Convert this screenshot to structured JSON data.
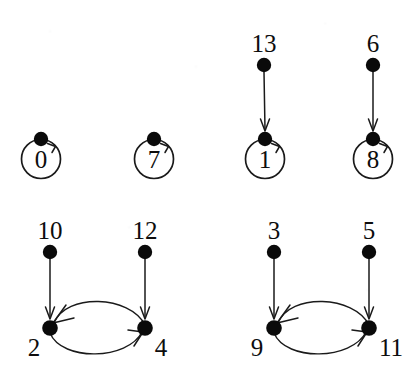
{
  "figure": {
    "kind": "directed-graph",
    "background_color": "#ffffff",
    "ink_color": "#1a1a1a",
    "node_fill_color": "#0a0a0a",
    "width": 417,
    "height": 392
  },
  "nodes": [
    {
      "id": "0",
      "label": "0",
      "cx": 41,
      "cy": 139,
      "label_x": 41,
      "label_y": 168,
      "label_placement": "inside-ring",
      "ring": true,
      "ring_cx": 41,
      "ring_cy": 159,
      "ring_r": 19.5
    },
    {
      "id": "7",
      "label": "7",
      "cx": 154,
      "cy": 139,
      "label_x": 154,
      "label_y": 168,
      "label_placement": "inside-ring",
      "ring": true,
      "ring_cx": 154,
      "ring_cy": 159,
      "ring_r": 19.5
    },
    {
      "id": "1",
      "label": "1",
      "cx": 265,
      "cy": 139,
      "label_x": 265,
      "label_y": 168,
      "label_placement": "inside-ring",
      "ring": true,
      "ring_cx": 265,
      "ring_cy": 159,
      "ring_r": 19.5
    },
    {
      "id": "8",
      "label": "8",
      "cx": 373,
      "cy": 139,
      "label_x": 373,
      "label_y": 168,
      "label_placement": "inside-ring",
      "ring": true,
      "ring_cx": 373,
      "ring_cy": 159,
      "ring_r": 19.5
    },
    {
      "id": "13",
      "label": "13",
      "cx": 264,
      "cy": 65,
      "label_x": 264,
      "label_y": 52,
      "label_placement": "above",
      "ring": false
    },
    {
      "id": "6",
      "label": "6",
      "cx": 373,
      "cy": 65,
      "label_x": 373,
      "label_y": 52,
      "label_placement": "above",
      "ring": false
    },
    {
      "id": "10",
      "label": "10",
      "cx": 50,
      "cy": 252,
      "label_x": 50,
      "label_y": 239,
      "label_placement": "above",
      "ring": false
    },
    {
      "id": "12",
      "label": "12",
      "cx": 145,
      "cy": 252,
      "label_x": 145,
      "label_y": 239,
      "label_placement": "above",
      "ring": false
    },
    {
      "id": "2",
      "label": "2",
      "cx": 50,
      "cy": 328,
      "label_x": 34,
      "label_y": 356,
      "label_placement": "below-left",
      "ring": false
    },
    {
      "id": "4",
      "label": "4",
      "cx": 145,
      "cy": 328,
      "label_x": 161,
      "label_y": 356,
      "label_placement": "below-right",
      "ring": false
    },
    {
      "id": "3",
      "label": "3",
      "cx": 274,
      "cy": 252,
      "label_x": 274,
      "label_y": 239,
      "label_placement": "above",
      "ring": false
    },
    {
      "id": "5",
      "label": "5",
      "cx": 369,
      "cy": 252,
      "label_x": 369,
      "label_y": 239,
      "label_placement": "above",
      "ring": false
    },
    {
      "id": "9",
      "label": "9",
      "cx": 274,
      "cy": 328,
      "label_x": 257,
      "label_y": 356,
      "label_placement": "below-left",
      "ring": false
    },
    {
      "id": "11",
      "label": "11",
      "cx": 369,
      "cy": 328,
      "label_x": 391,
      "label_y": 356,
      "label_placement": "below-right",
      "ring": false
    }
  ],
  "edges": [
    {
      "from": "0",
      "to": "0",
      "type": "self-loop"
    },
    {
      "from": "7",
      "to": "7",
      "type": "self-loop"
    },
    {
      "from": "1",
      "to": "1",
      "type": "self-loop"
    },
    {
      "from": "8",
      "to": "8",
      "type": "self-loop"
    },
    {
      "from": "13",
      "to": "1",
      "type": "straight"
    },
    {
      "from": "6",
      "to": "8",
      "type": "straight"
    },
    {
      "from": "10",
      "to": "2",
      "type": "straight"
    },
    {
      "from": "12",
      "to": "4",
      "type": "straight"
    },
    {
      "from": "3",
      "to": "9",
      "type": "straight"
    },
    {
      "from": "5",
      "to": "11",
      "type": "straight"
    },
    {
      "from": "4",
      "to": "2",
      "type": "curve-upper"
    },
    {
      "from": "2",
      "to": "4",
      "type": "curve-lower"
    },
    {
      "from": "11",
      "to": "9",
      "type": "curve-upper"
    },
    {
      "from": "9",
      "to": "11",
      "type": "curve-lower"
    }
  ],
  "components": [
    {
      "name": "component-0",
      "members": [
        "0"
      ]
    },
    {
      "name": "component-7",
      "members": [
        "7"
      ]
    },
    {
      "name": "component-1",
      "members": [
        "1",
        "13"
      ]
    },
    {
      "name": "component-8",
      "members": [
        "8",
        "6"
      ]
    },
    {
      "name": "component-2-4",
      "members": [
        "2",
        "4",
        "10",
        "12"
      ]
    },
    {
      "name": "component-9-11",
      "members": [
        "9",
        "11",
        "3",
        "5"
      ]
    }
  ]
}
